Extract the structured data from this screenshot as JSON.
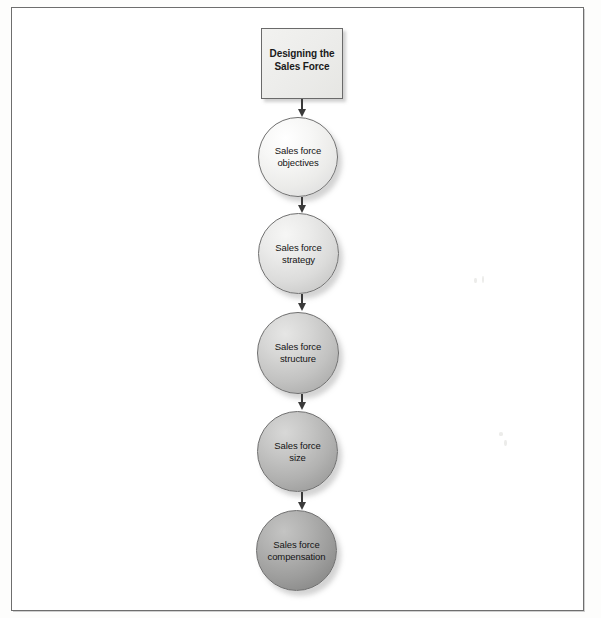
{
  "diagram": {
    "title_box": {
      "label": "Designing the\nSales Force"
    },
    "steps": [
      {
        "label": "Sales force\nobjectives",
        "shade": "#f2f2f0"
      },
      {
        "label": "Sales force\nstrategy",
        "shade": "#dcdcdb"
      },
      {
        "label": "Sales force\nstructure",
        "shade": "#c2c2c1"
      },
      {
        "label": "Sales force\nsize",
        "shade": "#b1b1b0"
      },
      {
        "label": "Sales force\ncompensation",
        "shade": "#9d9d9c"
      }
    ],
    "connector_icon": "down-arrow-icon",
    "frame_color": "#6e6e6e",
    "page_background": "#ffffff"
  }
}
